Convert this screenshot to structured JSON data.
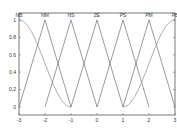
{
  "chart_data": {
    "type": "line",
    "title": "",
    "xlabel": "",
    "ylabel": "",
    "xlim": [
      -3,
      3
    ],
    "ylim": [
      -0.1,
      1.1
    ],
    "grid": false,
    "legend_position": "labels above each curve peak",
    "x_ticks": [
      -3,
      -2,
      -1,
      0,
      1,
      2,
      3
    ],
    "y_ticks": [
      0,
      0.2,
      0.4,
      0.6,
      0.8,
      1
    ],
    "series": [
      {
        "name": "NB",
        "shape": "z-curve",
        "peak_x": -3,
        "x": [
          -3,
          -2.5,
          -2,
          -1.5,
          -1
        ],
        "values": [
          1,
          0.85,
          0.5,
          0.15,
          0
        ]
      },
      {
        "name": "NM",
        "shape": "triangle",
        "peak_x": -2,
        "x": [
          -3,
          -2,
          -1
        ],
        "values": [
          0,
          1,
          0
        ]
      },
      {
        "name": "NS",
        "shape": "triangle",
        "peak_x": -1,
        "x": [
          -2,
          -1,
          0
        ],
        "values": [
          0,
          1,
          0
        ]
      },
      {
        "name": "ZE",
        "shape": "triangle",
        "peak_x": 0,
        "x": [
          -1,
          0,
          1
        ],
        "values": [
          0,
          1,
          0
        ]
      },
      {
        "name": "PS",
        "shape": "triangle",
        "peak_x": 1,
        "x": [
          0,
          1,
          2
        ],
        "values": [
          0,
          1,
          0
        ]
      },
      {
        "name": "PM",
        "shape": "triangle",
        "peak_x": 2,
        "x": [
          1,
          2,
          3
        ],
        "values": [
          0,
          1,
          0
        ]
      },
      {
        "name": "PB",
        "shape": "s-curve",
        "peak_x": 3,
        "x": [
          1,
          1.5,
          2,
          2.5,
          3
        ],
        "values": [
          0,
          0.15,
          0.5,
          0.85,
          1
        ]
      }
    ],
    "colors": {
      "lines": "#6e6e6e",
      "smooth_curves": "#8a8a8a",
      "axes": "#555555",
      "background": "#ffffff"
    }
  }
}
